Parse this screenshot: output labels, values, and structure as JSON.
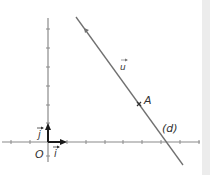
{
  "diagram": {
    "type": "cartesian-line",
    "origin_label": "O",
    "unit_x_label": "i",
    "unit_y_label": "j",
    "direction_vector_label": "u",
    "point_label": "A",
    "line_label": "(d)",
    "colors": {
      "axis": "#8a8a8a",
      "line": "#707070",
      "vector": "#1a1a1a",
      "text": "#333333",
      "panel": "#ececec"
    },
    "x_ticks": [
      -2,
      -1,
      1,
      2,
      3,
      4,
      5,
      6,
      7,
      8
    ],
    "y_ticks": [
      1,
      2,
      3,
      4,
      5,
      6
    ],
    "point_A": [
      4.8,
      2.0
    ],
    "line_x_intercept": 6.3
  }
}
